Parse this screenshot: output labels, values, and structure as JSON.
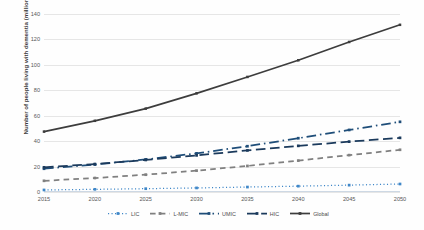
{
  "chart_data": {
    "type": "line",
    "title": "",
    "xlabel": "",
    "ylabel": "Number of people living with dementia (million)",
    "categories": [
      "2015",
      "2020",
      "2025",
      "2030",
      "2035",
      "2040",
      "2045",
      "2050"
    ],
    "x": [
      2015,
      2020,
      2025,
      2030,
      2035,
      2040,
      2045,
      2050
    ],
    "ylim": [
      0,
      140
    ],
    "ytick_values": [
      0,
      20,
      40,
      60,
      80,
      100,
      120,
      140
    ],
    "ytick_labels": [
      "0",
      "20",
      "40",
      "60",
      "80",
      "100",
      "120",
      "140"
    ],
    "grid": true,
    "legend_position": "bottom",
    "series": [
      {
        "name": "LIC",
        "values": [
          1.6,
          2.1,
          2.6,
          3.2,
          3.9,
          4.6,
          5.4,
          6.3
        ],
        "color": "#3f87c8",
        "style": "dotted"
      },
      {
        "name": "L-MIC",
        "values": [
          8.8,
          11.0,
          13.6,
          16.8,
          20.5,
          24.7,
          29.0,
          33.2
        ],
        "color": "#808080",
        "style": "dashed"
      },
      {
        "name": "UMIC",
        "values": [
          18.3,
          21.6,
          25.6,
          30.4,
          36.0,
          42.3,
          48.8,
          55.2
        ],
        "color": "#1f4e79",
        "style": "dashdot"
      },
      {
        "name": "HIC",
        "values": [
          19.4,
          22.0,
          25.2,
          28.8,
          32.7,
          36.3,
          39.6,
          42.6
        ],
        "color": "#1b3a5c",
        "style": "longdash"
      },
      {
        "name": "Global",
        "values": [
          47.5,
          56.0,
          65.6,
          77.6,
          90.5,
          103.6,
          118.0,
          131.5
        ],
        "color": "#3d3d3d",
        "style": "solid"
      }
    ]
  },
  "legend": {
    "items": [
      {
        "label": "LIC"
      },
      {
        "label": "L-MIC"
      },
      {
        "label": "UMIC"
      },
      {
        "label": "HIC"
      },
      {
        "label": "Global"
      }
    ]
  }
}
